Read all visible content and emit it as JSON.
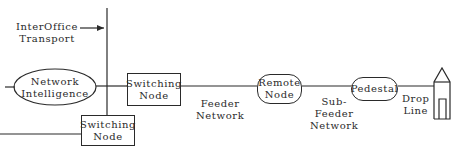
{
  "diagram": {
    "labels": {
      "interoffice": [
        "InterOffice",
        "Transport"
      ],
      "feeder": [
        "Feeder",
        "Network"
      ],
      "subfeeder": [
        "Sub-",
        "Feeder",
        "Network"
      ],
      "drop": [
        "Drop",
        "Line"
      ]
    },
    "nodes": {
      "network_intelligence": [
        "Network",
        "Intelligence"
      ],
      "switching_node_top": [
        "Switching",
        "Node"
      ],
      "switching_node_bottom": [
        "Switching",
        "Node"
      ],
      "remote_node": [
        "Remote",
        "Node"
      ],
      "pedestal": [
        "Pedestal"
      ]
    },
    "icons": {
      "house": "house-icon"
    },
    "colors": {
      "line": "#2a2a2a",
      "background": "#ffffff"
    }
  }
}
